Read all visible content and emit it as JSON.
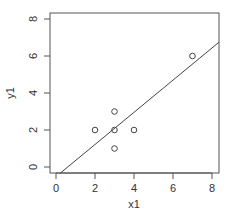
{
  "chart_data": {
    "type": "scatter",
    "title": "",
    "xlabel": "x1",
    "ylabel": "y1",
    "xlim": [
      -0.3,
      8.36
    ],
    "ylim": [
      -0.32,
      8.32
    ],
    "x_ticks": [
      0,
      2,
      4,
      6,
      8
    ],
    "y_ticks": [
      0,
      2,
      4,
      6,
      8
    ],
    "grid": false,
    "legend": null,
    "series": [
      {
        "name": "points",
        "marker": "open-circle",
        "x": [
          2,
          3,
          3,
          4,
          3,
          7
        ],
        "y": [
          2,
          3,
          2,
          2,
          1,
          6
        ]
      }
    ],
    "fit_line": {
      "type": "linear",
      "slope": 0.8696,
      "intercept": -0.522
    }
  },
  "labels": {
    "x_axis": "x1",
    "y_axis": "y1"
  },
  "colors": {
    "axis": "#555555",
    "points": "#444444",
    "line": "#444444"
  }
}
